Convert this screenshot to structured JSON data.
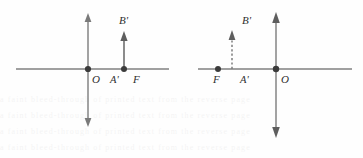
{
  "figure": {
    "background_color": "#fefefe",
    "line_color": "#818181",
    "dot_color": "#3b3b3b",
    "label_color": "#2e2e2e",
    "panels": [
      {
        "id": "left-panel",
        "name": "left-diagram",
        "axis_horizontal": {
          "x1": 16,
          "x2": 169,
          "y": 69
        },
        "axis_vertical": {
          "x": 88,
          "y1": 16,
          "y2": 124,
          "arrow_top": true,
          "arrow_bottom": true
        },
        "points": [
          {
            "label": "O",
            "name": "point-o",
            "x": 88,
            "y": 69,
            "label_x": 92,
            "label_y": 82,
            "dot": true
          },
          {
            "label": "A'",
            "name": "point-a-prime",
            "x": 117,
            "y": 69,
            "label_x": 111,
            "label_y": 82,
            "dot": false
          },
          {
            "label": "F",
            "name": "point-f",
            "x": 124,
            "y": 69,
            "label_x": 133,
            "label_y": 82,
            "dot": true
          }
        ],
        "arrow": {
          "label": "B'",
          "name": "arrow-b-prime",
          "style": "solid",
          "x": 124,
          "y_base": 69,
          "y_tip": 33,
          "label_x": 120,
          "label_y": 22
        }
      },
      {
        "id": "right-panel",
        "name": "right-diagram",
        "axis_horizontal": {
          "x1": 198,
          "x2": 352,
          "y": 69
        },
        "axis_vertical": {
          "x": 276,
          "y1": 13,
          "y2": 137,
          "arrow_top": true,
          "arrow_bottom": true
        },
        "points": [
          {
            "label": "F",
            "name": "point-f",
            "x": 218,
            "y": 69,
            "label_x": 214,
            "label_y": 82,
            "dot": true
          },
          {
            "label": "A'",
            "name": "point-a-prime",
            "x": 232,
            "y": 69,
            "label_x": 241,
            "label_y": 82,
            "dot": false
          },
          {
            "label": "O",
            "name": "point-o",
            "x": 276,
            "y": 69,
            "label_x": 281,
            "label_y": 82,
            "dot": true
          }
        ],
        "arrow": {
          "label": "B'",
          "name": "arrow-b-prime",
          "style": "dashed",
          "x": 232,
          "y_base": 69,
          "y_tip": 32,
          "label_x": 243,
          "label_y": 22
        }
      }
    ],
    "labels": {
      "o": "O",
      "a_prime": "A'",
      "f": "F",
      "b_prime": "B'"
    },
    "background_artifacts": [
      "a faint bleed-through of printed text from the reverse page",
      "a faint bleed-through of printed text from the reverse page",
      "a faint bleed-through of printed text from the reverse page",
      "a faint bleed-through of printed text from the reverse page"
    ]
  }
}
